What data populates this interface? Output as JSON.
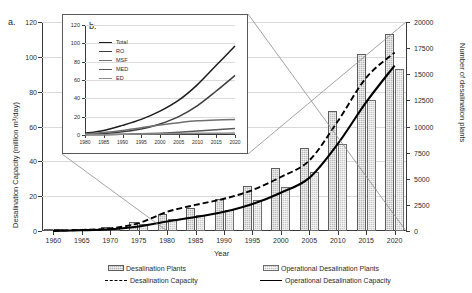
{
  "figure": {
    "panel_a_letter": "a.",
    "panel_b_letter": "b."
  },
  "axes": {
    "left_title": "Desalination Capacity (million m³/day)",
    "right_title": "Number of desalination plants",
    "x_title": "Year",
    "left_ticks": [
      "0",
      "20",
      "40",
      "60",
      "80",
      "100",
      "120"
    ],
    "right_ticks": [
      "0",
      "2500",
      "5000",
      "7500",
      "10000",
      "12500",
      "15000",
      "17500",
      "20000"
    ],
    "x_ticks": [
      "1960",
      "1965",
      "1970",
      "1975",
      "1980",
      "1985",
      "1990",
      "1995",
      "2000",
      "2005",
      "2010",
      "2015",
      "2020"
    ]
  },
  "legend": {
    "items": [
      {
        "key": "desalination-plants",
        "label": "Desalination Plants",
        "marker": "bar-hatch-dark"
      },
      {
        "key": "operational-desalination-plants",
        "label": "Operational Desalination Plants",
        "marker": "bar-hatch-light"
      },
      {
        "key": "desalination-capacity",
        "label": "Desalination Capacity",
        "marker": "dashed-line"
      },
      {
        "key": "operational-desalination-capacity",
        "label": "Operational Desalination Capacity",
        "marker": "solid-line"
      }
    ]
  },
  "inset_legend": {
    "items": [
      {
        "label": "Total",
        "color": "#1c1c1c"
      },
      {
        "label": "RO",
        "color": "#3d3d3d"
      },
      {
        "label": "MSF",
        "color": "#707070"
      },
      {
        "label": "MED",
        "color": "#585858"
      },
      {
        "label": "ED",
        "color": "#8a8a8a"
      }
    ]
  },
  "colors": {
    "bar_total": "#b8b8b8",
    "bar_operational": "#c9c9c9",
    "capacity_dashed": "#000000",
    "capacity_solid": "#000000",
    "grid": "#d9d9d9",
    "axis": "#3a3a3a"
  },
  "chart_data": [
    {
      "id": "panel-a",
      "type": "bar",
      "title": "",
      "xlabel": "Year",
      "ylabel": "Desalination Capacity (million m³/day)",
      "y2label": "Number of desalination plants",
      "xlim": [
        1958,
        2022
      ],
      "ylim": [
        0,
        120
      ],
      "y2lim": [
        0,
        20000
      ],
      "grid": true,
      "legend_position": "bottom",
      "categories": [
        1960,
        1965,
        1970,
        1975,
        1980,
        1985,
        1990,
        1995,
        2000,
        2005,
        2010,
        2015,
        2020
      ],
      "series": [
        {
          "name": "Desalination Plants",
          "axis": "right",
          "kind": "bar",
          "values": [
            60,
            180,
            420,
            900,
            1650,
            2250,
            3050,
            4350,
            6000,
            7900,
            11500,
            16900,
            18850
          ]
        },
        {
          "name": "Operational Desalination Plants",
          "axis": "right",
          "kind": "bar",
          "values": [
            40,
            120,
            300,
            650,
            1150,
            1550,
            2050,
            3000,
            4250,
            5600,
            8300,
            12500,
            15500
          ]
        },
        {
          "name": "Desalination Capacity",
          "axis": "left",
          "kind": "line",
          "style": "dashed",
          "values": [
            0.2,
            0.6,
            1.5,
            4.5,
            11.0,
            15.0,
            18.5,
            23.5,
            31.0,
            40.5,
            63.0,
            88.0,
            102.5
          ]
        },
        {
          "name": "Operational Desalination Capacity",
          "axis": "left",
          "kind": "line",
          "style": "solid",
          "values": [
            0.1,
            0.4,
            1.0,
            2.6,
            5.5,
            8.0,
            11.0,
            15.5,
            22.0,
            30.5,
            50.0,
            74.0,
            95.0
          ]
        }
      ]
    },
    {
      "id": "panel-b",
      "type": "line",
      "title": "",
      "xlabel": "",
      "ylabel": "",
      "xlim": [
        1980,
        2020
      ],
      "ylim": [
        0,
        120
      ],
      "grid": true,
      "legend_position": "upper-left",
      "x": [
        1980,
        1985,
        1990,
        1995,
        2000,
        2005,
        2010,
        2015,
        2020
      ],
      "series": [
        {
          "name": "Total",
          "values": [
            2.0,
            5.0,
            10.5,
            17.0,
            26.0,
            38.0,
            55.0,
            76.0,
            97.0
          ]
        },
        {
          "name": "RO",
          "values": [
            0.6,
            1.6,
            3.5,
            6.5,
            12.0,
            20.0,
            32.0,
            48.0,
            65.0
          ]
        },
        {
          "name": "MSF",
          "values": [
            1.0,
            2.6,
            5.0,
            8.0,
            11.0,
            13.5,
            15.5,
            16.3,
            17.0
          ]
        },
        {
          "name": "MED",
          "values": [
            0.2,
            0.4,
            0.8,
            1.3,
            2.0,
            3.0,
            4.4,
            5.7,
            7.0
          ]
        },
        {
          "name": "ED",
          "values": [
            0.2,
            0.4,
            0.7,
            1.0,
            1.4,
            1.7,
            1.9,
            2.0,
            2.1
          ]
        }
      ]
    }
  ]
}
